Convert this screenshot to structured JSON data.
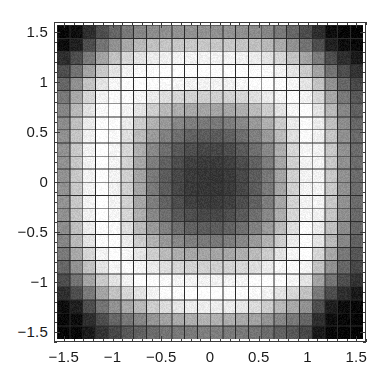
{
  "chart_data": {
    "type": "heatmap",
    "title": "",
    "xlabel": "",
    "ylabel": "",
    "colormap": "grayscale",
    "colormap_min_hex": "#000000",
    "colormap_max_hex": "#ffffff",
    "grid": true,
    "gridline_color_hex": "#2b2b2b",
    "frame_color_hex": "#3a3a3a",
    "background_hex": "#ffffff",
    "nx": 24,
    "ny": 24,
    "xlim": [
      -1.6,
      1.6
    ],
    "ylim": [
      -1.6,
      1.6
    ],
    "x_major_ticks": [
      -1.5,
      -1,
      -0.5,
      0,
      0.5,
      1,
      1.5
    ],
    "y_major_ticks": [
      -1.5,
      -1,
      -0.5,
      0,
      0.5,
      1,
      1.5
    ],
    "x_tick_labels": [
      "-1.5",
      "-1",
      "-0.5",
      "0",
      "0.5",
      "1",
      "1.5"
    ],
    "y_tick_labels": [
      "-1.5",
      "-1",
      "-0.5",
      "0",
      "0.5",
      "1",
      "1.5"
    ],
    "x_minor_tick_step": 0.1,
    "y_minor_tick_step": 0.1,
    "value_range": [
      0,
      1
    ],
    "cell_centers_x": [
      -1.533,
      -1.4,
      -1.267,
      -1.133,
      -1.0,
      -0.867,
      -0.733,
      -0.6,
      -0.467,
      -0.333,
      -0.2,
      -0.067,
      0.067,
      0.2,
      0.333,
      0.467,
      0.6,
      0.733,
      0.867,
      1.0,
      1.133,
      1.267,
      1.4,
      1.533
    ],
    "cell_centers_y": [
      1.533,
      1.4,
      1.267,
      1.133,
      1.0,
      0.867,
      0.733,
      0.6,
      0.467,
      0.333,
      0.2,
      0.067,
      -0.067,
      -0.2,
      -0.333,
      -0.467,
      -0.6,
      -0.733,
      -0.867,
      -1.0,
      -1.133,
      -1.267,
      -1.4,
      -1.533
    ],
    "values": [
      [
        0.03,
        0.05,
        0.18,
        0.3,
        0.4,
        0.47,
        0.52,
        0.55,
        0.56,
        0.57,
        0.57,
        0.57,
        0.57,
        0.57,
        0.56,
        0.55,
        0.52,
        0.47,
        0.4,
        0.3,
        0.18,
        0.05,
        0.03,
        0.02
      ],
      [
        0.05,
        0.12,
        0.3,
        0.45,
        0.57,
        0.66,
        0.72,
        0.75,
        0.77,
        0.78,
        0.78,
        0.78,
        0.78,
        0.78,
        0.77,
        0.75,
        0.72,
        0.66,
        0.57,
        0.45,
        0.3,
        0.12,
        0.05,
        0.03
      ],
      [
        0.18,
        0.3,
        0.48,
        0.64,
        0.76,
        0.84,
        0.89,
        0.92,
        0.94,
        0.95,
        0.95,
        0.95,
        0.95,
        0.95,
        0.94,
        0.92,
        0.89,
        0.84,
        0.76,
        0.64,
        0.48,
        0.3,
        0.18,
        0.1
      ],
      [
        0.3,
        0.45,
        0.64,
        0.79,
        0.89,
        0.95,
        0.98,
        0.99,
        1.0,
        1.0,
        1.0,
        1.0,
        1.0,
        1.0,
        1.0,
        0.99,
        0.98,
        0.95,
        0.89,
        0.79,
        0.64,
        0.45,
        0.3,
        0.2
      ],
      [
        0.4,
        0.57,
        0.76,
        0.89,
        0.96,
        0.99,
        1.0,
        0.99,
        0.98,
        0.96,
        0.95,
        0.95,
        0.95,
        0.95,
        0.96,
        0.99,
        1.0,
        0.99,
        0.96,
        0.89,
        0.76,
        0.57,
        0.4,
        0.28
      ],
      [
        0.47,
        0.66,
        0.84,
        0.95,
        0.99,
        0.99,
        0.96,
        0.92,
        0.87,
        0.84,
        0.82,
        0.81,
        0.81,
        0.82,
        0.84,
        0.87,
        0.92,
        0.96,
        0.99,
        0.95,
        0.84,
        0.66,
        0.47,
        0.34
      ],
      [
        0.52,
        0.72,
        0.89,
        0.98,
        1.0,
        0.96,
        0.89,
        0.8,
        0.73,
        0.68,
        0.65,
        0.64,
        0.64,
        0.65,
        0.68,
        0.73,
        0.8,
        0.89,
        0.96,
        1.0,
        0.89,
        0.72,
        0.52,
        0.38
      ],
      [
        0.55,
        0.75,
        0.92,
        0.99,
        0.99,
        0.92,
        0.8,
        0.69,
        0.6,
        0.53,
        0.49,
        0.47,
        0.47,
        0.49,
        0.53,
        0.6,
        0.69,
        0.8,
        0.92,
        0.99,
        0.92,
        0.75,
        0.55,
        0.4
      ],
      [
        0.56,
        0.77,
        0.94,
        1.0,
        0.98,
        0.87,
        0.73,
        0.6,
        0.5,
        0.43,
        0.38,
        0.36,
        0.36,
        0.38,
        0.43,
        0.5,
        0.6,
        0.73,
        0.87,
        0.98,
        0.94,
        0.77,
        0.56,
        0.41
      ],
      [
        0.57,
        0.78,
        0.95,
        1.0,
        0.96,
        0.84,
        0.68,
        0.53,
        0.43,
        0.35,
        0.3,
        0.28,
        0.28,
        0.3,
        0.35,
        0.43,
        0.53,
        0.68,
        0.84,
        0.96,
        0.95,
        0.78,
        0.57,
        0.42
      ],
      [
        0.57,
        0.78,
        0.95,
        1.0,
        0.95,
        0.82,
        0.65,
        0.49,
        0.38,
        0.3,
        0.25,
        0.23,
        0.23,
        0.25,
        0.3,
        0.38,
        0.49,
        0.65,
        0.82,
        0.95,
        0.95,
        0.78,
        0.57,
        0.42
      ],
      [
        0.57,
        0.78,
        0.95,
        1.0,
        0.95,
        0.81,
        0.64,
        0.47,
        0.36,
        0.28,
        0.23,
        0.21,
        0.21,
        0.23,
        0.28,
        0.36,
        0.47,
        0.64,
        0.81,
        0.95,
        0.95,
        0.78,
        0.57,
        0.42
      ],
      [
        0.57,
        0.78,
        0.95,
        1.0,
        0.95,
        0.81,
        0.64,
        0.47,
        0.36,
        0.28,
        0.23,
        0.21,
        0.21,
        0.23,
        0.28,
        0.36,
        0.47,
        0.64,
        0.81,
        0.95,
        0.95,
        0.78,
        0.57,
        0.42
      ],
      [
        0.57,
        0.78,
        0.95,
        1.0,
        0.95,
        0.82,
        0.65,
        0.49,
        0.38,
        0.3,
        0.25,
        0.23,
        0.23,
        0.25,
        0.3,
        0.38,
        0.49,
        0.65,
        0.82,
        0.95,
        0.95,
        0.78,
        0.57,
        0.42
      ],
      [
        0.56,
        0.77,
        0.94,
        1.0,
        0.96,
        0.84,
        0.68,
        0.53,
        0.43,
        0.35,
        0.3,
        0.28,
        0.28,
        0.3,
        0.35,
        0.43,
        0.53,
        0.68,
        0.84,
        0.96,
        0.94,
        0.77,
        0.56,
        0.41
      ],
      [
        0.55,
        0.75,
        0.92,
        0.99,
        0.98,
        0.87,
        0.73,
        0.6,
        0.5,
        0.43,
        0.38,
        0.36,
        0.36,
        0.38,
        0.43,
        0.5,
        0.6,
        0.73,
        0.87,
        0.98,
        0.92,
        0.75,
        0.55,
        0.4
      ],
      [
        0.52,
        0.72,
        0.89,
        0.98,
        0.99,
        0.92,
        0.8,
        0.69,
        0.6,
        0.53,
        0.49,
        0.47,
        0.47,
        0.49,
        0.53,
        0.6,
        0.69,
        0.8,
        0.92,
        0.99,
        0.89,
        0.72,
        0.52,
        0.38
      ],
      [
        0.47,
        0.66,
        0.84,
        0.95,
        1.0,
        0.96,
        0.89,
        0.8,
        0.73,
        0.68,
        0.65,
        0.64,
        0.64,
        0.65,
        0.68,
        0.73,
        0.8,
        0.89,
        0.96,
        1.0,
        0.84,
        0.66,
        0.47,
        0.34
      ],
      [
        0.4,
        0.57,
        0.76,
        0.89,
        0.96,
        0.99,
        0.96,
        0.92,
        0.87,
        0.84,
        0.82,
        0.81,
        0.81,
        0.82,
        0.84,
        0.87,
        0.92,
        0.96,
        0.99,
        0.96,
        0.76,
        0.57,
        0.4,
        0.28
      ],
      [
        0.3,
        0.45,
        0.64,
        0.79,
        0.89,
        0.95,
        1.0,
        0.99,
        0.98,
        0.96,
        0.95,
        0.95,
        0.95,
        0.95,
        0.96,
        0.99,
        1.0,
        0.99,
        0.96,
        0.89,
        0.64,
        0.45,
        0.3,
        0.2
      ],
      [
        0.18,
        0.3,
        0.48,
        0.64,
        0.76,
        0.84,
        0.89,
        0.95,
        0.98,
        0.99,
        1.0,
        1.0,
        1.0,
        1.0,
        0.99,
        0.98,
        0.95,
        0.89,
        0.84,
        0.76,
        0.48,
        0.3,
        0.18,
        0.1
      ],
      [
        0.05,
        0.12,
        0.3,
        0.45,
        0.57,
        0.66,
        0.72,
        0.8,
        0.86,
        0.9,
        0.92,
        0.93,
        0.93,
        0.92,
        0.9,
        0.86,
        0.8,
        0.72,
        0.66,
        0.57,
        0.3,
        0.12,
        0.05,
        0.03
      ],
      [
        0.03,
        0.05,
        0.18,
        0.3,
        0.4,
        0.47,
        0.52,
        0.58,
        0.63,
        0.66,
        0.68,
        0.69,
        0.69,
        0.68,
        0.66,
        0.63,
        0.58,
        0.52,
        0.47,
        0.4,
        0.18,
        0.05,
        0.03,
        0.02
      ],
      [
        0.02,
        0.03,
        0.1,
        0.2,
        0.28,
        0.34,
        0.38,
        0.42,
        0.45,
        0.47,
        0.48,
        0.49,
        0.49,
        0.48,
        0.47,
        0.45,
        0.42,
        0.38,
        0.34,
        0.28,
        0.1,
        0.03,
        0.02,
        0.01
      ]
    ]
  },
  "figure": {
    "frame": {
      "left_px": 54,
      "top_px": 22,
      "width_px": 312,
      "height_px": 320
    }
  }
}
